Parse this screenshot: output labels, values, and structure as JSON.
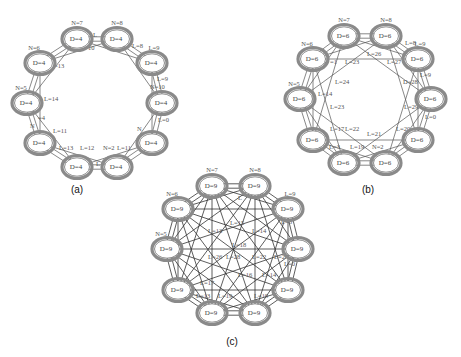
{
  "figure": {
    "panels": [
      {
        "id": "a",
        "caption": "(a)",
        "caption_pos": [
          77,
          193
        ],
        "degree_label": "D=4",
        "edge_density": "ring",
        "offsets": [
          1,
          2
        ],
        "nodes": [
          {
            "cx": 77,
            "cy": 39,
            "n_label": "N=7",
            "d_label": "D=4"
          },
          {
            "cx": 117,
            "cy": 39,
            "n_label": "N=8",
            "d_label": "D=4"
          },
          {
            "cx": 152,
            "cy": 63,
            "n_label": "L=9",
            "d_label": "D=4"
          },
          {
            "cx": 162,
            "cy": 103,
            "n_label": "",
            "d_label": "D=4"
          },
          {
            "cx": 152,
            "cy": 143,
            "n_label": "",
            "d_label": "D=4"
          },
          {
            "cx": 117,
            "cy": 167,
            "n_label": "",
            "d_label": "D=4"
          },
          {
            "cx": 77,
            "cy": 167,
            "n_label": "",
            "d_label": "D=4"
          },
          {
            "cx": 40,
            "cy": 143,
            "n_label": "",
            "d_label": "D=4"
          },
          {
            "cx": 27,
            "cy": 103,
            "n_label": "N=5",
            "d_label": "D=4"
          },
          {
            "cx": 40,
            "cy": 63,
            "n_label": "N=6",
            "d_label": "D=4"
          }
        ],
        "link_labels": [
          {
            "x": 93,
            "y": 37,
            "text": "L"
          },
          {
            "x": 88,
            "y": 50,
            "text": "10"
          },
          {
            "x": 54,
            "y": 68,
            "text": "=13"
          },
          {
            "x": 157,
            "y": 81,
            "text": "L=9"
          },
          {
            "x": 150,
            "y": 89,
            "text": "N=10"
          },
          {
            "x": 158,
            "y": 122,
            "text": "L=0"
          },
          {
            "x": 44,
            "y": 101,
            "text": "L=14"
          },
          {
            "x": 53,
            "y": 133,
            "text": "L=11"
          },
          {
            "x": 59,
            "y": 150,
            "text": "L=13"
          },
          {
            "x": 80,
            "y": 150,
            "text": "L=12"
          },
          {
            "x": 103,
            "y": 150,
            "text": "N=2"
          },
          {
            "x": 117,
            "y": 150,
            "text": "L=11"
          },
          {
            "x": 96,
            "y": 166,
            "text": "L"
          },
          {
            "x": 30,
            "y": 128,
            "text": "N"
          },
          {
            "x": 38,
            "y": 120,
            "text": "=4"
          },
          {
            "x": 137,
            "y": 131,
            "text": "N"
          },
          {
            "x": 132,
            "y": 48,
            "text": "L=8"
          }
        ]
      },
      {
        "id": "b",
        "caption": "(b)",
        "caption_pos": [
          368,
          193
        ],
        "degree_label": "D=6",
        "edge_density": "ring-plus",
        "offsets": [
          1,
          2,
          3
        ],
        "nodes": [
          {
            "cx": 344,
            "cy": 36,
            "n_label": "N=7",
            "d_label": "D=6"
          },
          {
            "cx": 386,
            "cy": 36,
            "n_label": "N=8",
            "d_label": "D=6"
          },
          {
            "cx": 418,
            "cy": 59,
            "n_label": "L=9",
            "d_label": "D=6"
          },
          {
            "cx": 431,
            "cy": 99,
            "n_label": "",
            "d_label": "D=6"
          },
          {
            "cx": 418,
            "cy": 140,
            "n_label": "",
            "d_label": "D=6"
          },
          {
            "cx": 386,
            "cy": 163,
            "n_label": "",
            "d_label": "D=6"
          },
          {
            "cx": 344,
            "cy": 163,
            "n_label": "",
            "d_label": "D=6"
          },
          {
            "cx": 313,
            "cy": 140,
            "n_label": "",
            "d_label": "D=6"
          },
          {
            "cx": 300,
            "cy": 99,
            "n_label": "N=5",
            "d_label": "D=6"
          },
          {
            "cx": 313,
            "cy": 59,
            "n_label": "N=6",
            "d_label": "D=6"
          }
        ],
        "link_labels": [
          {
            "x": 367,
            "y": 56,
            "text": "L=26"
          },
          {
            "x": 345,
            "y": 64,
            "text": "L=23"
          },
          {
            "x": 387,
            "y": 64,
            "text": "L=27"
          },
          {
            "x": 330,
            "y": 64,
            "text": "=1"
          },
          {
            "x": 335,
            "y": 84,
            "text": "L=24"
          },
          {
            "x": 318,
            "y": 96,
            "text": "L=14"
          },
          {
            "x": 330,
            "y": 109,
            "text": "L=23"
          },
          {
            "x": 403,
            "y": 84,
            "text": "D=28"
          },
          {
            "x": 420,
            "y": 77,
            "text": "L=9"
          },
          {
            "x": 404,
            "y": 109,
            "text": "L=29"
          },
          {
            "x": 425,
            "y": 119,
            "text": "L=0"
          },
          {
            "x": 330,
            "y": 131,
            "text": "L=17"
          },
          {
            "x": 345,
            "y": 131,
            "text": "L=22"
          },
          {
            "x": 396,
            "y": 131,
            "text": "L=20"
          },
          {
            "x": 367,
            "y": 136,
            "text": "L=21"
          },
          {
            "x": 329,
            "y": 149,
            "text": "L=3"
          },
          {
            "x": 350,
            "y": 149,
            "text": "L=19"
          },
          {
            "x": 372,
            "y": 149,
            "text": "N=2"
          },
          {
            "x": 405,
            "y": 45,
            "text": "L=8"
          }
        ]
      },
      {
        "id": "c",
        "caption": "(c)",
        "caption_pos": [
          232,
          345
        ],
        "degree_label": "D=9",
        "edge_density": "complete",
        "offsets": [
          1,
          2,
          3,
          4,
          5
        ],
        "nodes": [
          {
            "cx": 212,
            "cy": 186,
            "n_label": "N=7",
            "d_label": "D=9"
          },
          {
            "cx": 255,
            "cy": 186,
            "n_label": "N=8",
            "d_label": "D=9"
          },
          {
            "cx": 288,
            "cy": 209,
            "n_label": "L=9",
            "d_label": "D=9"
          },
          {
            "cx": 298,
            "cy": 249,
            "n_label": "",
            "d_label": "D=9"
          },
          {
            "cx": 288,
            "cy": 290,
            "n_label": "",
            "d_label": "D=9"
          },
          {
            "cx": 255,
            "cy": 313,
            "n_label": "",
            "d_label": "D=9"
          },
          {
            "cx": 212,
            "cy": 313,
            "n_label": "",
            "d_label": "D=9"
          },
          {
            "cx": 178,
            "cy": 290,
            "n_label": "",
            "d_label": "D=9"
          },
          {
            "cx": 167,
            "cy": 249,
            "n_label": "N=5",
            "d_label": "D=9"
          },
          {
            "cx": 178,
            "cy": 209,
            "n_label": "N=6",
            "d_label": "D=9"
          }
        ],
        "link_labels": [
          {
            "x": 230,
            "y": 225,
            "text": "L=15"
          },
          {
            "x": 208,
            "y": 233,
            "text": "L=13"
          },
          {
            "x": 252,
            "y": 233,
            "text": "L=14"
          },
          {
            "x": 232,
            "y": 247,
            "text": "L=18"
          },
          {
            "x": 208,
            "y": 259,
            "text": "L=26"
          },
          {
            "x": 226,
            "y": 259,
            "text": "L=28"
          },
          {
            "x": 252,
            "y": 259,
            "text": "L=22"
          },
          {
            "x": 274,
            "y": 259,
            "text": "L=24"
          },
          {
            "x": 200,
            "y": 285,
            "text": "L=17"
          },
          {
            "x": 238,
            "y": 277,
            "text": "L=16"
          },
          {
            "x": 262,
            "y": 277,
            "text": "L=14"
          },
          {
            "x": 196,
            "y": 298,
            "text": "L=13"
          },
          {
            "x": 218,
            "y": 298,
            "text": "L=19"
          },
          {
            "x": 254,
            "y": 298,
            "text": "L=19"
          },
          {
            "x": 281,
            "y": 224,
            "text": "L=8"
          },
          {
            "x": 284,
            "y": 266,
            "text": "L=0"
          },
          {
            "x": 238,
            "y": 200,
            "text": "L"
          }
        ]
      }
    ]
  },
  "colors": {
    "node_stroke": "#8a8a8a",
    "edge": "#555555",
    "background": "#ffffff",
    "text": "#444444"
  }
}
